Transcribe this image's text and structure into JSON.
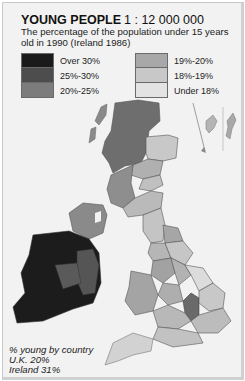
{
  "map": {
    "title": "YOUNG PEOPLE",
    "scale": "1 : 12 000 000",
    "subtitle": "The percentage of the population under 15 years old in 1990 (Ireland 1986)"
  },
  "legend": {
    "left": [
      {
        "label": "Over 30%",
        "color": "#1a1a1a"
      },
      {
        "label": "25%-30%",
        "color": "#4d4d4d"
      },
      {
        "label": "20%-25%",
        "color": "#7c7c7c"
      }
    ],
    "right": [
      {
        "label": "19%-20%",
        "color": "#a8a8a8"
      },
      {
        "label": "18%-19%",
        "color": "#c8c8c8"
      },
      {
        "label": "Under 18%",
        "color": "#e3e3e3"
      }
    ]
  },
  "country_note": {
    "heading": "% young by country",
    "uk": "U.K. 20%",
    "ireland": "Ireland 31%"
  },
  "colors": {
    "background": "#f2f2f2",
    "border_lines": "#555555",
    "sea_outline": "#9a9a9a"
  }
}
